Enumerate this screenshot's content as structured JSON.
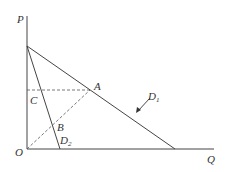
{
  "diagram": {
    "axes": {
      "vertical_label": "P",
      "horizontal_label": "Q",
      "origin_label": "O"
    },
    "points": {
      "A": "A",
      "B": "B",
      "C": "C"
    },
    "curves": [
      {
        "name": "D",
        "subscript": "1"
      },
      {
        "name": "D",
        "subscript": "2"
      }
    ],
    "colors": {
      "line": "#444444",
      "dashed": "#555555",
      "background": "#ffffff"
    }
  }
}
